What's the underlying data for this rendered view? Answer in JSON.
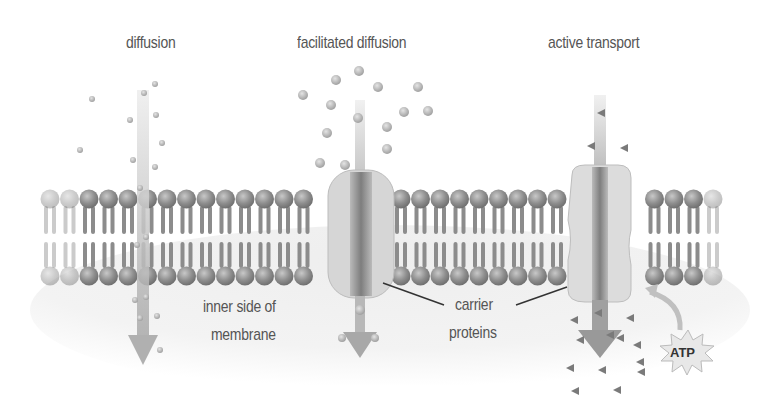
{
  "diagram": {
    "title_labels": {
      "diffusion": "diffusion",
      "facilitated_diffusion": "facilitated diffusion",
      "active_transport": "active transport"
    },
    "annotations": {
      "inner_side_line1": "inner side of",
      "inner_side_line2": "membrane",
      "carrier_line1": "carrier",
      "carrier_line2": "proteins",
      "atp": "ATP"
    },
    "structures": [
      "phospholipid bilayer",
      "carrier protein (facilitated diffusion)",
      "carrier protein (active transport)"
    ],
    "colors": {
      "membrane_head": "#9a9a9a",
      "membrane_tail": "#8a8a8a",
      "protein_body": "#d8d8d8",
      "channel": "#7a7a7a",
      "arrow": "#b4b4b4",
      "inner_region": "#f0f0f0",
      "text": "#555555"
    }
  }
}
